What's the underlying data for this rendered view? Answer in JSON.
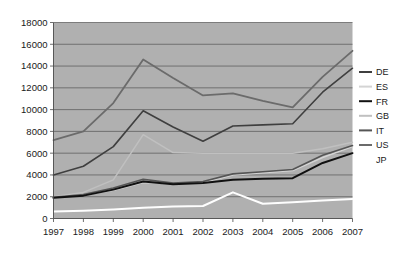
{
  "chart_data": {
    "type": "line",
    "title": "",
    "xlabel": "",
    "ylabel": "",
    "grid": true,
    "legend_position": "right",
    "plot_background": "#b0b0b0",
    "categories": [
      "1997",
      "1998",
      "1999",
      "2000",
      "2001",
      "2002",
      "2003",
      "2004",
      "2005",
      "2006",
      "2007"
    ],
    "x": [
      1997,
      1998,
      1999,
      2000,
      2001,
      2002,
      2003,
      2004,
      2005,
      2006,
      2007
    ],
    "ylim": [
      0,
      18000
    ],
    "yticks": [
      0,
      2000,
      4000,
      6000,
      8000,
      10000,
      12000,
      14000,
      16000,
      18000
    ],
    "ytick_labels": [
      "0",
      "2000",
      "4000",
      "6000",
      "8000",
      "10000",
      "12000",
      "14000",
      "16000",
      "18000"
    ],
    "series": [
      {
        "name": "DE",
        "color": "#3f3f3f",
        "width": 1.6,
        "values": [
          4000,
          4800,
          6600,
          9900,
          8400,
          7100,
          8500,
          8600,
          8700,
          11600,
          13800
        ]
      },
      {
        "name": "ES",
        "color": "#d4d4d4",
        "width": 1.5,
        "values": [
          1950,
          2150,
          2600,
          3300,
          3200,
          3300,
          4000,
          4200,
          4400,
          5600,
          6600
        ]
      },
      {
        "name": "FR",
        "color": "#111111",
        "width": 2.0,
        "values": [
          1900,
          2100,
          2650,
          3400,
          3150,
          3250,
          3550,
          3650,
          3700,
          5100,
          6000
        ]
      },
      {
        "name": "GB",
        "color": "#c0c0c0",
        "width": 1.5,
        "values": [
          2000,
          2400,
          3550,
          7700,
          6050,
          6000,
          6000,
          6000,
          6000,
          6400,
          7000
        ]
      },
      {
        "name": "IT",
        "color": "#555555",
        "width": 1.6,
        "values": [
          1950,
          2200,
          2800,
          3600,
          3250,
          3400,
          4100,
          4300,
          4500,
          5800,
          6700
        ]
      },
      {
        "name": "US",
        "color": "#6b6b6b",
        "width": 1.8,
        "values": [
          7200,
          8000,
          10600,
          14600,
          12900,
          11300,
          11500,
          10800,
          10200,
          13000,
          15400
        ]
      },
      {
        "name": "JP",
        "color": "#fefefe",
        "width": 2.0,
        "values": [
          650,
          720,
          820,
          980,
          1100,
          1150,
          2400,
          1350,
          1500,
          1650,
          1800
        ]
      }
    ]
  },
  "legend": {
    "items": [
      {
        "label": "DE",
        "color": "#3f3f3f",
        "has_swatch": true
      },
      {
        "label": "ES",
        "color": "#d4d4d4",
        "has_swatch": true
      },
      {
        "label": "FR",
        "color": "#111111",
        "has_swatch": true
      },
      {
        "label": "GB",
        "color": "#c0c0c0",
        "has_swatch": true
      },
      {
        "label": "IT",
        "color": "#555555",
        "has_swatch": true
      },
      {
        "label": "US",
        "color": "#6b6b6b",
        "has_swatch": true
      },
      {
        "label": "JP",
        "color": "#fefefe",
        "has_swatch": false
      }
    ]
  }
}
